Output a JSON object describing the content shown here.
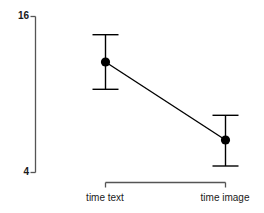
{
  "chart_data": {
    "type": "line",
    "title": "",
    "subtitle": "",
    "xlabel": "",
    "ylabel": "",
    "categories": [
      "time text",
      "time image"
    ],
    "x": [
      1,
      2
    ],
    "values": [
      12.5,
      6.5
    ],
    "error_low": [
      10.4,
      4.5
    ],
    "error_high": [
      14.6,
      8.4
    ],
    "series": [
      {
        "name": "mean",
        "values": [
          12.5,
          6.5
        ],
        "error_low": [
          10.4,
          4.5
        ],
        "error_high": [
          14.6,
          8.4
        ]
      }
    ],
    "ylim": [
      4,
      16
    ],
    "y_ticks": [
      4,
      16
    ],
    "y_tick_labels": [
      "4",
      "16"
    ],
    "x_ticks": [
      1,
      2
    ],
    "x_tick_labels": [
      "time text",
      "time image"
    ],
    "grid": false,
    "legend": false,
    "legend_position": "none",
    "axis_style": "bracket",
    "marker": "filled-circle",
    "line_color": "#000000",
    "marker_color": "#000000",
    "error_bar_color": "#000000",
    "axis_color": "#4d4d4d",
    "background": "#ffffff",
    "annotations": []
  },
  "axis": {
    "y_top_label": "16",
    "y_bottom_label": "4"
  },
  "labels": {
    "category_0": "time text",
    "category_1": "time image"
  }
}
